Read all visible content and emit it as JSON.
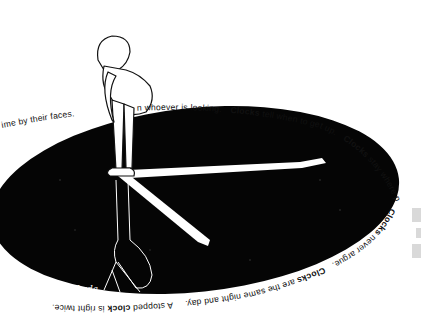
{
  "artwork": {
    "subject": "girl standing on the center of a black clock face, clock hands drawn as white shadows",
    "colors": {
      "background": "#ffffff",
      "clock_face": "#050505",
      "hands": "#ffffff",
      "text": "#111111",
      "side_blocks": "#d9d9d9"
    },
    "ring_text": {
      "top_left": "ime by their faces.",
      "top_middle": "n whoever is looking.",
      "top_right_bold": "Clocks",
      "top_right": " tell when to get up.",
      "right_bold": "Clocks",
      "right": " stay where put.",
      "bottom_right_bold": "Clocks",
      "bottom_right": " never argue.",
      "bottom_mid_bold": "Clocks",
      "bottom_mid": " are the same night and day.",
      "bottom_left_pre": "A stopped ",
      "bottom_left_bold": "clock",
      "bottom_left": " is right twice."
    },
    "signature": "Lyda"
  }
}
